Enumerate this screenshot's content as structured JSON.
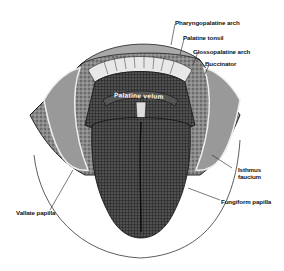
{
  "diagram": {
    "labels": {
      "pharyngopalatine_arch": "Pharyngopalatine arch",
      "palatine_tonsil": "Palatine tonsil",
      "glossopalatine_arch": "Glossopalatine arch",
      "buccinator": "Buccinator",
      "isthmus_faucium_line1": "Isthmus",
      "isthmus_faucium_line2": "faucium",
      "fungiform_papilla": "Fungiform papilla",
      "vallate_papilla": "Vallate papilla",
      "palatine_velum": "Palatine velum"
    },
    "colors": {
      "background": "#ffffff",
      "ink": "#111111",
      "dark_tissue": "#2a2a2a",
      "mid_tissue": "#6a6a6a",
      "light_tissue": "#bdbdbd"
    }
  }
}
